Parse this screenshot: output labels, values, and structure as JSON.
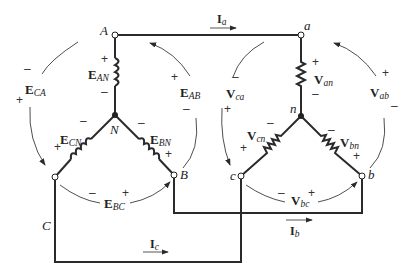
{
  "diagram": {
    "type": "three-phase Y-Y circuit",
    "source_nodes": {
      "A": "A",
      "B": "B",
      "C": "C",
      "N": "N"
    },
    "load_nodes": {
      "a": "a",
      "b": "b",
      "c": "c",
      "n": "n"
    },
    "source_phase_voltages": [
      {
        "main": "E",
        "sub": "AN"
      },
      {
        "main": "E",
        "sub": "BN"
      },
      {
        "main": "E",
        "sub": "CN"
      }
    ],
    "source_line_voltages": [
      {
        "main": "E",
        "sub": "AB"
      },
      {
        "main": "E",
        "sub": "BC"
      },
      {
        "main": "E",
        "sub": "CA"
      }
    ],
    "load_phase_voltages": [
      {
        "main": "V",
        "sub": "an"
      },
      {
        "main": "V",
        "sub": "bn"
      },
      {
        "main": "V",
        "sub": "cn"
      }
    ],
    "load_line_voltages": [
      {
        "main": "V",
        "sub": "ab"
      },
      {
        "main": "V",
        "sub": "bc"
      },
      {
        "main": "V",
        "sub": "ca"
      }
    ],
    "line_currents": [
      {
        "main": "I",
        "sub": "a"
      },
      {
        "main": "I",
        "sub": "b"
      },
      {
        "main": "I",
        "sub": "c"
      }
    ],
    "plus": "+",
    "minus": "–"
  }
}
